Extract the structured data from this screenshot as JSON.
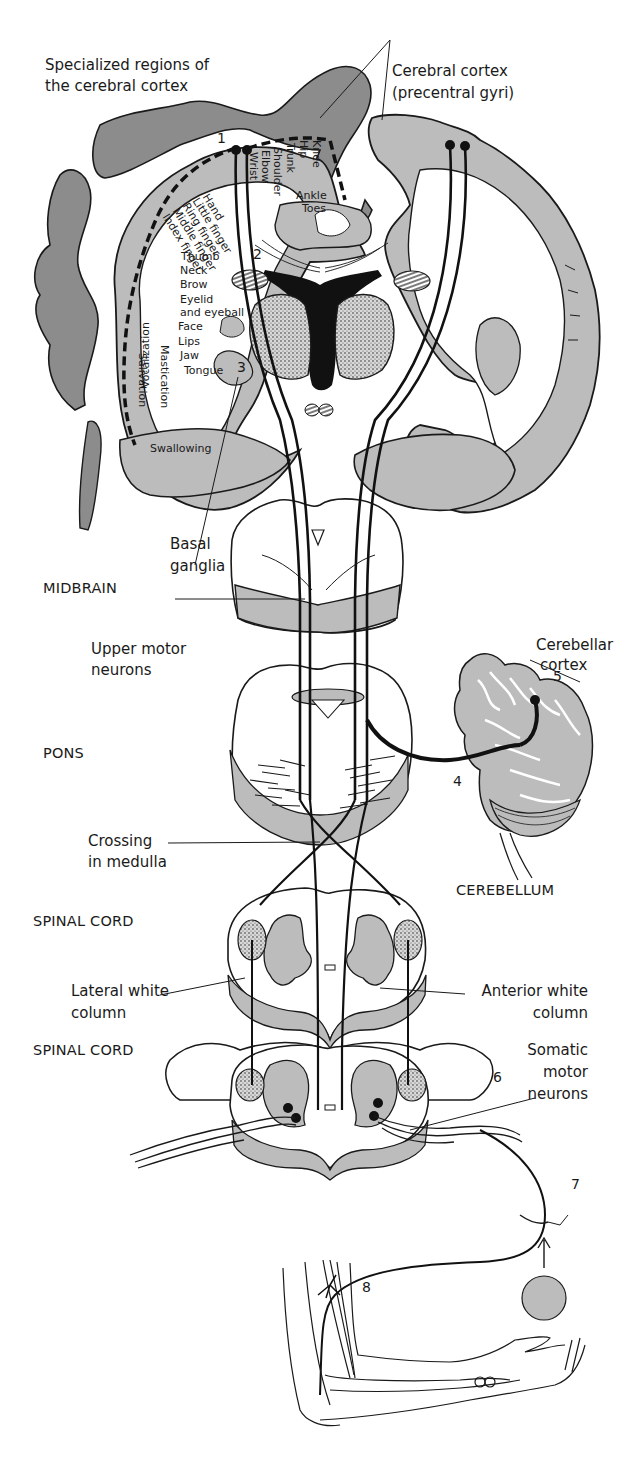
{
  "figure": {
    "title_labels": {
      "specialized_regions": [
        "Specialized regions of",
        "the cerebral cortex"
      ],
      "cerebral_cortex": [
        "Cerebral cortex",
        "(precentral gyri)"
      ],
      "basal_ganglia": [
        "Basal",
        "ganglia"
      ],
      "upper_motor_neurons": [
        "Upper motor",
        "neurons"
      ],
      "cerebellar_cortex": [
        "Cerebellar",
        "cortex"
      ],
      "crossing_in_medulla": [
        "Crossing",
        "in medulla"
      ],
      "lateral_white_column": [
        "Lateral white",
        "column"
      ],
      "anterior_white_column": [
        "Anterior white",
        "column"
      ],
      "somatic_motor_neurons": [
        "Somatic",
        "motor",
        "neurons"
      ]
    },
    "region_labels": {
      "midbrain": "MIDBRAIN",
      "pons": "PONS",
      "cerebellum": "CEREBELLUM",
      "spinal_cord_1": "SPINAL CORD",
      "spinal_cord_2": "SPINAL CORD"
    },
    "homunculus_labels": {
      "vertical_top": [
        "Wrist",
        "Elbow",
        "Shoulder",
        "Trunk",
        "Hip",
        "Knee"
      ],
      "ankle": "Ankle",
      "toes": "Toes",
      "diagonal": [
        "Hand",
        "Little finger",
        "Ring finger",
        "Middle finger",
        "Index finger"
      ],
      "side": [
        "Thumb",
        "Neck",
        "Brow",
        "Eyelid",
        "and eyeball",
        "Face",
        "Lips",
        "Jaw",
        "Tongue",
        "Swallowing"
      ],
      "vertical_side": [
        "Vocalization",
        "Salivation",
        "Mastication"
      ]
    },
    "step_numbers": [
      "1",
      "2",
      "3",
      "4",
      "5",
      "6",
      "7",
      "8"
    ],
    "colors": {
      "gray_matter": "#b8b8b8",
      "dark_gray": "#8a8a8a",
      "outline": "#1a1a1a",
      "background": "#ffffff"
    }
  }
}
